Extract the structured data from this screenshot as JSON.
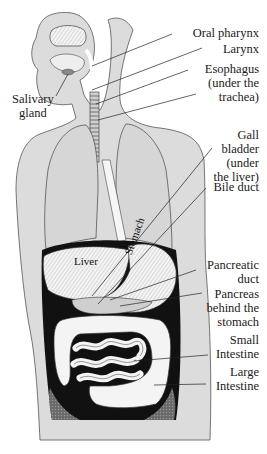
{
  "colors": {
    "body_fill": "#dcdcdc",
    "body_outline": "#555555",
    "organ_fill": "#f2f2f2",
    "dark": "#111111",
    "leader": "#222222",
    "text": "#1a1a1a"
  },
  "labels": {
    "oral_pharynx": "Oral pharynx",
    "larynx": "Larynx",
    "esophagus": "Esophagus\n(under the\ntrachea)",
    "salivary_gland": "Salivary\ngland",
    "gall_bladder": "Gall\nbladder\n(under\nthe liver)",
    "bile_duct": "Bile duct",
    "pancreatic_duct": "Pancreatic\nduct",
    "pancreas": "Pancreas\nbehind the\nstomach",
    "small_intestine": "Small\nIntestine",
    "large_intestine": "Large\nIntestine"
  },
  "organ_labels": {
    "liver": "Liver",
    "stomach": "Stomach"
  }
}
